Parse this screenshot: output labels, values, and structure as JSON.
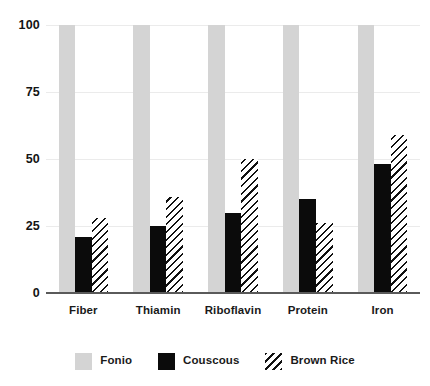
{
  "chart_data": {
    "type": "bar",
    "title": "",
    "subtitle": "",
    "xlabel": "",
    "ylabel": "",
    "categories": [
      "Fiber",
      "Thiamin",
      "Riboflavin",
      "Protein",
      "Iron"
    ],
    "series": [
      {
        "name": "Fonio",
        "values": [
          100,
          100,
          100,
          100,
          100
        ],
        "color": "#d4d4d4",
        "fill": "solid"
      },
      {
        "name": "Couscous",
        "values": [
          21,
          25,
          30,
          35,
          48
        ],
        "color": "#0b0b0b",
        "fill": "solid"
      },
      {
        "name": "Brown Rice",
        "values": [
          28,
          36,
          50,
          26,
          59
        ],
        "color": "#111111",
        "fill": "diagonal-hatch"
      }
    ],
    "ylim": [
      0,
      100
    ],
    "yticks": [
      "0",
      "25",
      "50",
      "75",
      "100"
    ],
    "ytick_values": [
      0,
      25,
      50,
      75,
      100
    ],
    "grid": true,
    "grid_axis": "y",
    "legend_position": "bottom-center",
    "bar_mode": "grouped"
  },
  "axis": {
    "baseline_color": "#5a5a5a",
    "gridline_color": "#ebebeb"
  },
  "legend": {
    "items": [
      {
        "label": "Fonio"
      },
      {
        "label": "Couscous"
      },
      {
        "label": "Brown Rice"
      }
    ]
  }
}
